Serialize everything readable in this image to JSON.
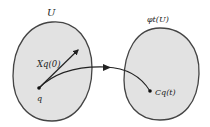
{
  "diagram": {
    "left_region": {
      "label": "U",
      "fill": "#e2e2e2",
      "stroke": "#444444"
    },
    "right_region": {
      "label": "φt(U)",
      "fill": "#e2e2e2",
      "stroke": "#444444"
    },
    "point_q": {
      "label": "q"
    },
    "vector": {
      "label": "Xq(0)"
    },
    "image_point": {
      "label": "Cq(t)"
    },
    "curve": {
      "description": "integral curve from q to Cq(t)"
    }
  }
}
